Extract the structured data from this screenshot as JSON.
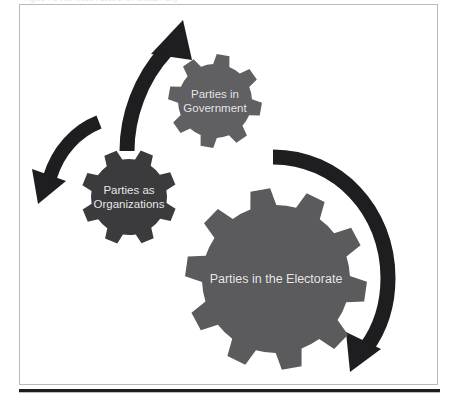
{
  "figure": {
    "caption_partial": "Figure 7.1 The Three Faces of a Political Party",
    "border_color": "#b9b9bd",
    "background": "#ffffff"
  },
  "colors": {
    "gear_gov": "#605f62",
    "gear_org": "#3b3b3d",
    "gear_electorate": "#5b5b5d",
    "arrow": "#1e1e20",
    "label_text": "#e9e9ec",
    "rule": "#1d1d1f"
  },
  "gears": [
    {
      "id": "parties-in-government",
      "label": "Parties in\nGovernment",
      "cx": 195,
      "cy": 96,
      "outer_radius": 47,
      "inner_radius": 37,
      "teeth": 8,
      "rotation": 10,
      "color": "#605f62",
      "label_font_size": 11.5
    },
    {
      "id": "parties-as-organizations",
      "label": "Parties as\nOrganizations",
      "cx": 109,
      "cy": 192,
      "outer_radius": 48,
      "inner_radius": 38,
      "teeth": 8,
      "rotation": 22,
      "color": "#3b3b3d",
      "label_font_size": 11.5
    },
    {
      "id": "parties-in-the-electorate",
      "label": "Parties in the Electorate",
      "cx": 256,
      "cy": 274,
      "outer_radius": 91,
      "inner_radius": 74,
      "teeth": 10,
      "rotation": 8,
      "color": "#5b5b5d",
      "label_font_size": 12.5
    }
  ],
  "arrows": [
    {
      "id": "arrow-org-to-government",
      "direction": "up-right",
      "description": "curved arrow from Parties as Organizations up to Parties in Government"
    },
    {
      "id": "arrow-government-to-org",
      "direction": "down-left",
      "description": "curved arrow sweeping down-left toward Parties as Organizations"
    },
    {
      "id": "arrow-electorate",
      "direction": "clockwise-right",
      "description": "large curved arrow sweeping clockwise around Parties in the Electorate"
    }
  ]
}
